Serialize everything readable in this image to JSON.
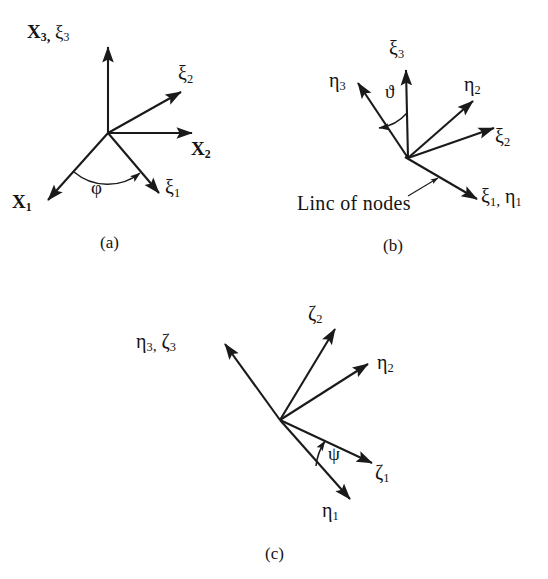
{
  "figure": {
    "title_visible": false,
    "background_color": "#ffffff",
    "stroke_color": "#1a1a1a",
    "panels": [
      {
        "id": "a",
        "caption": "(a)",
        "angle_symbol": "φ",
        "axes": [
          {
            "name": "X3-xi3",
            "label_main": "X",
            "label_sub": "3",
            "label_second_main": "ξ",
            "label_second_sub": "3"
          },
          {
            "name": "xi2",
            "label_main": "ξ",
            "label_sub": "2"
          },
          {
            "name": "X2",
            "label_main": "X",
            "label_sub": "2"
          },
          {
            "name": "xi1",
            "label_main": "ξ",
            "label_sub": "1"
          },
          {
            "name": "X1",
            "label_main": "X",
            "label_sub": "1"
          }
        ]
      },
      {
        "id": "b",
        "caption": "(b)",
        "angle_symbol": "ϑ",
        "note": "Linc of nodes",
        "axes": [
          {
            "name": "xi3",
            "label_main": "ξ",
            "label_sub": "3"
          },
          {
            "name": "eta3",
            "label_main": "η",
            "label_sub": "3"
          },
          {
            "name": "eta2",
            "label_main": "η",
            "label_sub": "2"
          },
          {
            "name": "xi2",
            "label_main": "ξ",
            "label_sub": "2"
          },
          {
            "name": "xi1-eta1",
            "label_main": "ξ",
            "label_sub": "1",
            "label_second_main": "η",
            "label_second_sub": "1"
          }
        ]
      },
      {
        "id": "c",
        "caption": "(c)",
        "angle_symbol": "ψ",
        "axes": [
          {
            "name": "eta3-zeta3",
            "label_main": "η",
            "label_sub": "3",
            "label_second_main": "ζ",
            "label_second_sub": "3"
          },
          {
            "name": "zeta2",
            "label_main": "ζ",
            "label_sub": "2"
          },
          {
            "name": "eta2",
            "label_main": "η",
            "label_sub": "2"
          },
          {
            "name": "zeta1",
            "label_main": "ζ",
            "label_sub": "1"
          },
          {
            "name": "eta1",
            "label_main": "η",
            "label_sub": "1"
          }
        ]
      }
    ]
  },
  "labels": {
    "a": {
      "x3_xi3": {
        "m1": "X",
        "s1": "3",
        "m2": "ξ",
        "s2": "3"
      },
      "xi2": {
        "m": "ξ",
        "s": "2"
      },
      "x2": {
        "m": "X",
        "s": "2"
      },
      "xi1": {
        "m": "ξ",
        "s": "1"
      },
      "x1": {
        "m": "X",
        "s": "1"
      },
      "phi": "φ",
      "caption": "(a)"
    },
    "b": {
      "xi3": {
        "m": "ξ",
        "s": "3"
      },
      "eta3": {
        "m": "η",
        "s": "3"
      },
      "eta2": {
        "m": "η",
        "s": "2"
      },
      "xi2": {
        "m": "ξ",
        "s": "2"
      },
      "xi1_eta1": {
        "m1": "ξ",
        "s1": "1",
        "m2": "η",
        "s2": "1"
      },
      "theta": "ϑ",
      "line_of_nodes": "Linc of nodes",
      "caption": "(b)"
    },
    "c": {
      "eta3_zeta3": {
        "m1": "η",
        "s1": "3",
        "m2": "ζ",
        "s2": "3"
      },
      "zeta2": {
        "m": "ζ",
        "s": "2"
      },
      "eta2": {
        "m": "η",
        "s": "2"
      },
      "zeta1": {
        "m": "ζ",
        "s": "1"
      },
      "eta1": {
        "m": "η",
        "s": "1"
      },
      "psi": "ψ",
      "caption": "(c)"
    }
  },
  "separators": {
    "comma": ","
  }
}
